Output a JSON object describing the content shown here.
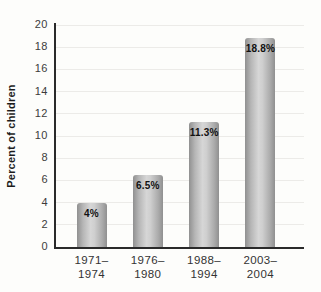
{
  "chart_data": {
    "type": "bar",
    "title": "",
    "xlabel": "",
    "ylabel": "Percent of children",
    "categories": [
      "1971–\n1974",
      "1976–\n1980",
      "1988–\n1994",
      "2003–\n2004"
    ],
    "values": [
      4,
      6.5,
      11.3,
      18.8
    ],
    "value_labels": [
      "4%",
      "6.5%",
      "11.3%",
      "18.8%"
    ],
    "yticks": [
      0,
      2,
      4,
      6,
      8,
      10,
      12,
      14,
      16,
      18,
      20
    ],
    "ylim": [
      0,
      20
    ],
    "grid": "horizontal-only",
    "legend": "none",
    "colors": {
      "background": "#fdfdfb",
      "axis": "#2a2a2a",
      "gridline": "#ecebe8",
      "bar_edge": "#909090",
      "bar_center": "#d6d6d6",
      "tick_text": "#3c3c3c",
      "value_label": "#111111"
    }
  }
}
